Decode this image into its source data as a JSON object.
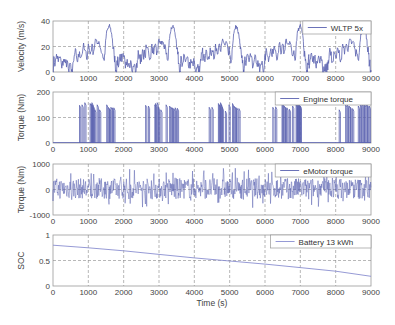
{
  "chart_data": [
    {
      "type": "line",
      "panel": 1,
      "ylabel": "Velocity (m/s)",
      "legend": "WLTP 5x",
      "ylim": [
        0,
        40
      ],
      "yticks": [
        "0",
        "20",
        "40"
      ],
      "xlim": [
        0,
        9000
      ],
      "xticks": [
        "0",
        "1000",
        "2000",
        "3000",
        "4000",
        "5000",
        "6000",
        "7000",
        "8000",
        "9000"
      ],
      "grid": true,
      "series_color": "#5a62b0",
      "description": "WLTP drive cycle repeated 5 times (~1800 s each); low phase ~0-15 m/s, medium ~20-25, high ~25-28, extra-high peaks ~36 m/s",
      "cycle_profile": {
        "x": [
          0,
          30,
          60,
          100,
          150,
          200,
          250,
          300,
          350,
          400,
          450,
          500,
          550,
          590,
          620,
          660,
          700,
          750,
          800,
          850,
          900,
          950,
          1000,
          1050,
          1100,
          1150,
          1200,
          1250,
          1300,
          1350,
          1400,
          1450,
          1480,
          1510,
          1540,
          1560,
          1590,
          1620,
          1650,
          1680,
          1700,
          1730,
          1760,
          1790,
          1800
        ],
        "y": [
          0,
          12,
          5,
          14,
          8,
          12,
          3,
          10,
          7,
          9,
          0,
          6,
          0,
          9,
          15,
          13,
          8,
          16,
          12,
          19,
          17,
          10,
          22,
          14,
          22,
          16,
          26,
          22,
          24,
          18,
          14,
          9,
          20,
          30,
          33,
          34,
          36,
          35,
          31,
          26,
          18,
          14,
          7,
          0,
          0
        ]
      }
    },
    {
      "type": "line",
      "panel": 2,
      "ylabel": "Torque (Nm)",
      "legend": "Engine torque",
      "ylim": [
        0,
        200
      ],
      "yticks": [
        "0",
        "100",
        "200"
      ],
      "xlim": [
        0,
        9000
      ],
      "xticks": [
        "0",
        "1000",
        "2000",
        "3000",
        "4000",
        "5000",
        "6000",
        "7000",
        "8000",
        "9000"
      ],
      "grid": true,
      "series_color": "#5a62b0",
      "description": "Engine on/off pulses ~130-160 Nm, mostly clustered in medium/high phases of each cycle",
      "pulse_x": [
        750,
        820,
        900,
        1050,
        1080,
        1100,
        1120,
        1150,
        1180,
        1250,
        1320,
        1520,
        1560,
        1600,
        1640,
        1680,
        1720,
        2620,
        2700,
        2880,
        2900,
        2950,
        2980,
        3050,
        3200,
        3300,
        3340,
        3380,
        3420,
        3460,
        3520,
        4420,
        4500,
        4680,
        4700,
        4740,
        4760,
        4790,
        4880,
        4980,
        5080,
        5120,
        5160,
        5200,
        5260,
        6220,
        6300,
        6480,
        6500,
        6540,
        6580,
        6620,
        6690,
        6780,
        6880,
        6900,
        6920,
        6940,
        6960,
        6980,
        7000,
        8100,
        8280,
        8330,
        8380,
        8420,
        8480,
        8640,
        8700,
        8740,
        8780,
        8820,
        8860,
        8900,
        8950
      ],
      "pulse_y": [
        148,
        150,
        158,
        155,
        152,
        158,
        150,
        140,
        130,
        150,
        130,
        150,
        140,
        135,
        140,
        138,
        138,
        148,
        145,
        150,
        155,
        158,
        140,
        130,
        150,
        145,
        140,
        138,
        135,
        138,
        136,
        140,
        140,
        155,
        150,
        158,
        150,
        140,
        125,
        150,
        155,
        145,
        140,
        138,
        135,
        140,
        142,
        158,
        155,
        145,
        140,
        138,
        132,
        145,
        150,
        155,
        158,
        152,
        150,
        148,
        145,
        130,
        150,
        150,
        145,
        140,
        135,
        145,
        150,
        152,
        155,
        150,
        150,
        148,
        145
      ]
    },
    {
      "type": "line",
      "panel": 3,
      "ylabel": "Torque (Nm)",
      "legend": "eMotor torque",
      "ylim": [
        -1000,
        1000
      ],
      "yticks": [
        "-1000",
        "0",
        "1000"
      ],
      "xlim": [
        0,
        9000
      ],
      "xticks": [
        "0",
        "1000",
        "2000",
        "3000",
        "4000",
        "5000",
        "6000",
        "7000",
        "8000",
        "9000"
      ],
      "grid": true,
      "series_color": "#5a62b0",
      "description": "Electric motor torque oscillating between about -800 and +900 Nm throughout all cycles"
    },
    {
      "type": "line",
      "panel": 4,
      "ylabel": "SOC",
      "xlabel": "Time (s)",
      "legend": "Battery 13 kWh",
      "ylim": [
        0,
        1
      ],
      "yticks": [
        "0",
        "0.5",
        "1"
      ],
      "xlim": [
        0,
        9000
      ],
      "xticks": [
        "0",
        "1000",
        "2000",
        "3000",
        "4000",
        "5000",
        "6000",
        "7000",
        "8000",
        "9000"
      ],
      "grid": true,
      "series_color": "#8a8fd0",
      "x": [
        0,
        1000,
        2000,
        3000,
        4000,
        5000,
        6000,
        7000,
        8000,
        9000
      ],
      "values": [
        0.8,
        0.75,
        0.69,
        0.62,
        0.55,
        0.49,
        0.43,
        0.36,
        0.29,
        0.19
      ]
    }
  ]
}
